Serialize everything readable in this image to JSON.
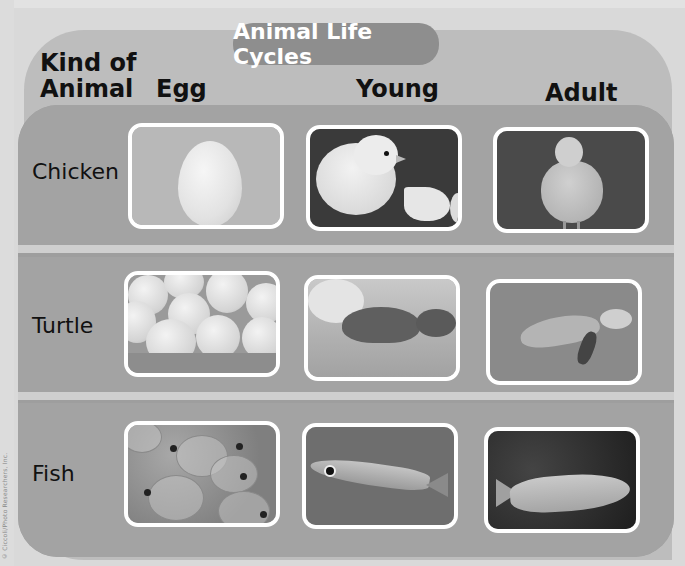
{
  "page": {
    "title": "Animal Life Cycles",
    "side_credit": "© Ciccoli/Photo Researchers, Inc."
  },
  "table": {
    "column_headers": {
      "kind": "Kind of Animal",
      "kind_line1": "Kind of",
      "kind_line2": "Animal",
      "egg": "Egg",
      "young": "Young",
      "adult": "Adult"
    },
    "rows": [
      {
        "animal": "Chicken",
        "egg_image": "white chicken egg",
        "young_image": "yellow chick beside broken eggshell",
        "adult_image": "adult hen"
      },
      {
        "animal": "Turtle",
        "egg_image": "clutch of round turtle eggs in sand",
        "young_image": "hatchling turtle on sand",
        "adult_image": "adult sea turtle swimming"
      },
      {
        "animal": "Fish",
        "egg_image": "cluster of translucent fish eggs",
        "young_image": "young fish (fry) swimming",
        "adult_image": "adult trout"
      }
    ]
  },
  "colors": {
    "panel_light": "#bdbdbd",
    "table_dark": "#9e9e9e",
    "title_pill": "#8e8e8e",
    "divider": "#cfcfcf",
    "photo_border": "#ffffff"
  }
}
